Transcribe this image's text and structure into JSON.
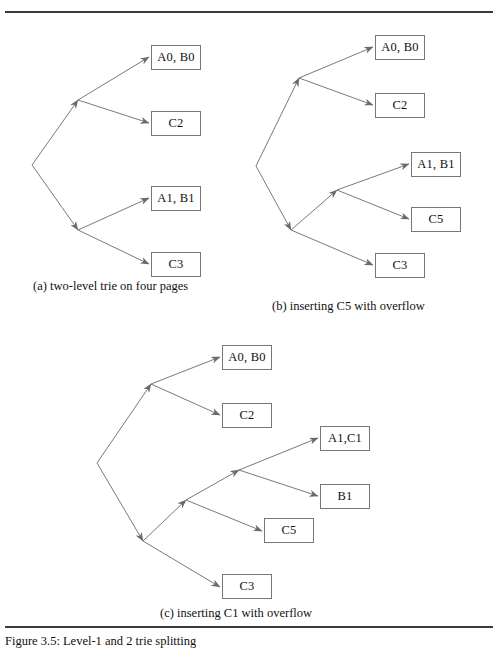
{
  "figure": {
    "caption_bottom": "Figure 3.5: Level-1 and 2 trie splitting",
    "rule_color": "#3a3a3a",
    "box_border_color": "#777777",
    "edge_color": "#6a6a6a",
    "text_color": "#111111"
  },
  "panels": [
    {
      "id": "a",
      "caption": "(a) two-level trie on four pages",
      "caption_x": 33,
      "caption_y": 280,
      "boxes": [
        {
          "label": "A0, B0",
          "x": 151,
          "y": 45,
          "w": 50,
          "h": 25
        },
        {
          "label": "C2",
          "x": 151,
          "y": 111,
          "w": 50,
          "h": 25
        },
        {
          "label": "A1, B1",
          "x": 151,
          "y": 186,
          "w": 50,
          "h": 25
        },
        {
          "label": "C3",
          "x": 151,
          "y": 252,
          "w": 50,
          "h": 25
        }
      ],
      "nodes": [
        {
          "name": "root",
          "x": 32,
          "y": 165
        },
        {
          "name": "internal-0",
          "x": 78,
          "y": 100
        },
        {
          "name": "internal-1",
          "x": 78,
          "y": 230
        }
      ],
      "edges": [
        {
          "from": [
            32,
            165
          ],
          "to": [
            78,
            100
          ]
        },
        {
          "from": [
            32,
            165
          ],
          "to": [
            78,
            230
          ]
        },
        {
          "from": [
            78,
            100
          ],
          "to": [
            149,
            57
          ]
        },
        {
          "from": [
            78,
            100
          ],
          "to": [
            149,
            123
          ]
        },
        {
          "from": [
            78,
            230
          ],
          "to": [
            149,
            198
          ]
        },
        {
          "from": [
            78,
            230
          ],
          "to": [
            149,
            264
          ]
        }
      ]
    },
    {
      "id": "b",
      "caption": "(b) inserting C5 with overflow",
      "caption_x": 272,
      "caption_y": 300,
      "boxes": [
        {
          "label": "A0, B0",
          "x": 375,
          "y": 35,
          "w": 50,
          "h": 25
        },
        {
          "label": "C2",
          "x": 375,
          "y": 93,
          "w": 50,
          "h": 25
        },
        {
          "label": "A1, B1",
          "x": 411,
          "y": 152,
          "w": 50,
          "h": 25
        },
        {
          "label": "C5",
          "x": 411,
          "y": 207,
          "w": 50,
          "h": 25
        },
        {
          "label": "C3",
          "x": 375,
          "y": 253,
          "w": 50,
          "h": 25
        }
      ],
      "nodes": [
        {
          "name": "root",
          "x": 256,
          "y": 166
        },
        {
          "name": "internal-0",
          "x": 299,
          "y": 78
        },
        {
          "name": "internal-1",
          "x": 291,
          "y": 230
        },
        {
          "name": "internal-2",
          "x": 337,
          "y": 190
        }
      ],
      "edges": [
        {
          "from": [
            256,
            166
          ],
          "to": [
            299,
            78
          ]
        },
        {
          "from": [
            256,
            166
          ],
          "to": [
            291,
            230
          ]
        },
        {
          "from": [
            299,
            78
          ],
          "to": [
            373,
            47
          ]
        },
        {
          "from": [
            299,
            78
          ],
          "to": [
            373,
            105
          ]
        },
        {
          "from": [
            291,
            230
          ],
          "to": [
            337,
            190
          ]
        },
        {
          "from": [
            291,
            230
          ],
          "to": [
            373,
            265
          ]
        },
        {
          "from": [
            337,
            190
          ],
          "to": [
            409,
            164
          ]
        },
        {
          "from": [
            337,
            190
          ],
          "to": [
            409,
            219
          ]
        }
      ]
    },
    {
      "id": "c",
      "caption": "(c) inserting C1 with overflow",
      "caption_x": 160,
      "caption_y": 607,
      "boxes": [
        {
          "label": "A0, B0",
          "x": 222,
          "y": 345,
          "w": 50,
          "h": 25
        },
        {
          "label": "C2",
          "x": 222,
          "y": 403,
          "w": 50,
          "h": 25
        },
        {
          "label": "A1,C1",
          "x": 320,
          "y": 426,
          "w": 50,
          "h": 25
        },
        {
          "label": "B1",
          "x": 320,
          "y": 484,
          "w": 50,
          "h": 25
        },
        {
          "label": "C5",
          "x": 264,
          "y": 518,
          "w": 50,
          "h": 25
        },
        {
          "label": "C3",
          "x": 222,
          "y": 574,
          "w": 50,
          "h": 25
        }
      ],
      "nodes": [
        {
          "name": "root",
          "x": 97,
          "y": 463
        },
        {
          "name": "internal-0",
          "x": 151,
          "y": 384
        },
        {
          "name": "internal-1",
          "x": 143,
          "y": 541
        },
        {
          "name": "internal-2",
          "x": 186,
          "y": 500
        },
        {
          "name": "internal-3",
          "x": 239,
          "y": 470
        }
      ],
      "edges": [
        {
          "from": [
            97,
            463
          ],
          "to": [
            151,
            384
          ]
        },
        {
          "from": [
            97,
            463
          ],
          "to": [
            143,
            541
          ]
        },
        {
          "from": [
            151,
            384
          ],
          "to": [
            220,
            357
          ]
        },
        {
          "from": [
            151,
            384
          ],
          "to": [
            220,
            415
          ]
        },
        {
          "from": [
            143,
            541
          ],
          "to": [
            186,
            500
          ]
        },
        {
          "from": [
            143,
            541
          ],
          "to": [
            220,
            587
          ]
        },
        {
          "from": [
            186,
            500
          ],
          "to": [
            239,
            470
          ]
        },
        {
          "from": [
            186,
            500
          ],
          "to": [
            262,
            531
          ]
        },
        {
          "from": [
            239,
            470
          ],
          "to": [
            318,
            438
          ]
        },
        {
          "from": [
            239,
            470
          ],
          "to": [
            318,
            496
          ]
        }
      ]
    }
  ]
}
